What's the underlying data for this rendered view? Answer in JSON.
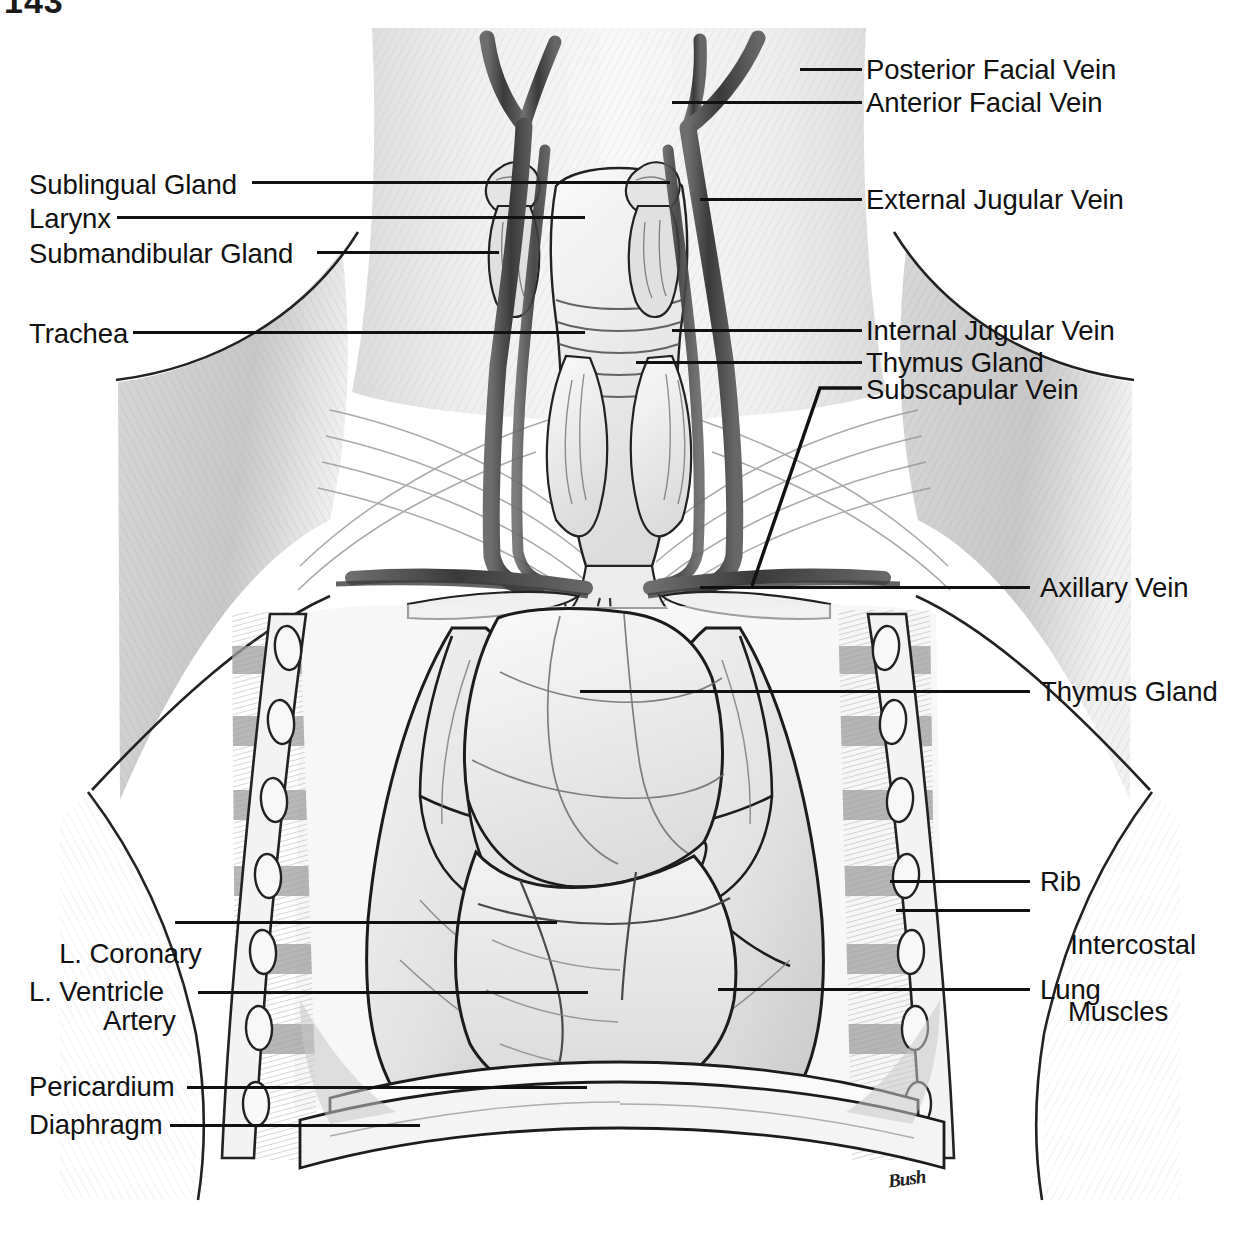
{
  "plate": {
    "page_number": "143",
    "artist_signature": "Bush",
    "title": "Ventral view of the neck and opened thorax"
  },
  "labels_right": [
    {
      "id": "posterior-facial-vein",
      "text": "Posterior Facial Vein",
      "y": 55,
      "leader_x": 846,
      "leader_w": 56,
      "text_x": 866
    },
    {
      "id": "anterior-facial-vein",
      "text": "Anterior Facial Vein",
      "y": 88,
      "leader_x": 846,
      "leader_w": 56,
      "text_x": 866
    },
    {
      "id": "external-jugular-vein",
      "text": "External Jugular Vein",
      "y": 185,
      "leader_x": 846,
      "leader_w": 56,
      "text_x": 866
    },
    {
      "id": "internal-jugular-vein",
      "text": "Internal Jugular Vein",
      "y": 316,
      "leader_x": 846,
      "leader_w": 56,
      "text_x": 866
    },
    {
      "id": "thymus-gland-neck",
      "text": "Thymus Gland",
      "y": 348,
      "leader_x": 846,
      "leader_w": 56,
      "text_x": 866
    },
    {
      "id": "subscapular-vein",
      "text": "Subscapular Vein",
      "y": 375,
      "leader_x": 846,
      "leader_w": 0,
      "text_x": 866
    },
    {
      "id": "axillary-vein",
      "text": "Axillary Vein",
      "y": 573,
      "leader_x": 1018,
      "leader_w": 60,
      "text_x": 1040
    },
    {
      "id": "thymus-gland-chest",
      "text": "Thymus Gland",
      "y": 677,
      "leader_x": 1018,
      "leader_w": 60,
      "text_x": 1040
    },
    {
      "id": "rib",
      "text": "Rib",
      "y": 867,
      "leader_x": 1018,
      "leader_w": 60,
      "text_x": 1040
    },
    {
      "id": "lung",
      "text": "Lung",
      "y": 975,
      "leader_x": 1018,
      "leader_w": 60,
      "text_x": 1040
    }
  ],
  "labels_right_multiline": [
    {
      "id": "intercostal-muscles",
      "line1": "Intercostal",
      "line2": "Muscles",
      "y": 896,
      "leader_x": 1018,
      "leader_w": 60,
      "text_x": 1040
    }
  ],
  "labels_left": [
    {
      "id": "sublingual-gland",
      "text": "Sublingual Gland",
      "y": 170,
      "text_x": 29,
      "leader_x": 252,
      "leader_w": 418
    },
    {
      "id": "larynx",
      "text": "Larynx",
      "y": 203,
      "text_x": 29,
      "leader_x": 117,
      "leader_w": 468
    },
    {
      "id": "submandibular-gland",
      "text": "Submandibular Gland",
      "y": 238,
      "text_x": 29,
      "leader_x": 317,
      "leader_w": 182
    },
    {
      "id": "trachea",
      "text": "Trachea",
      "y": 318,
      "text_x": 29,
      "leader_x": 133,
      "leader_w": 452
    },
    {
      "id": "l-ventricle",
      "text": "L. Ventricle",
      "y": 977,
      "text_x": 29,
      "leader_x": 198,
      "leader_w": 390
    },
    {
      "id": "pericardium",
      "text": "Pericardium",
      "y": 1072,
      "text_x": 29,
      "leader_x": 187,
      "leader_w": 400
    },
    {
      "id": "diaphragm",
      "text": "Diaphragm",
      "y": 1110,
      "text_x": 29,
      "leader_x": 170,
      "leader_w": 250
    }
  ],
  "labels_left_multiline": [
    {
      "id": "l-coronary-artery",
      "line1": "L. Coronary",
      "line2": "Artery",
      "y": 905,
      "text_x": 29,
      "leader_x": 175,
      "leader_w": 382
    }
  ],
  "colors": {
    "ink": "#111111",
    "paper": "#ffffff",
    "vein_dark": "#4a4a4a",
    "tissue_light": "#e9e9e9",
    "tissue_mid": "#cfcfcf",
    "muscle_shadow": "#9a9a9a"
  },
  "anatomy_parts": [
    "Posterior Facial Vein",
    "Anterior Facial Vein",
    "External Jugular Vein",
    "Internal Jugular Vein",
    "Subscapular Vein",
    "Axillary Vein",
    "Sublingual Gland",
    "Submandibular Gland",
    "Larynx",
    "Trachea",
    "Thymus Gland",
    "Lung",
    "Rib",
    "Intercostal Muscles",
    "L. Coronary Artery",
    "L. Ventricle",
    "Pericardium",
    "Diaphragm"
  ]
}
